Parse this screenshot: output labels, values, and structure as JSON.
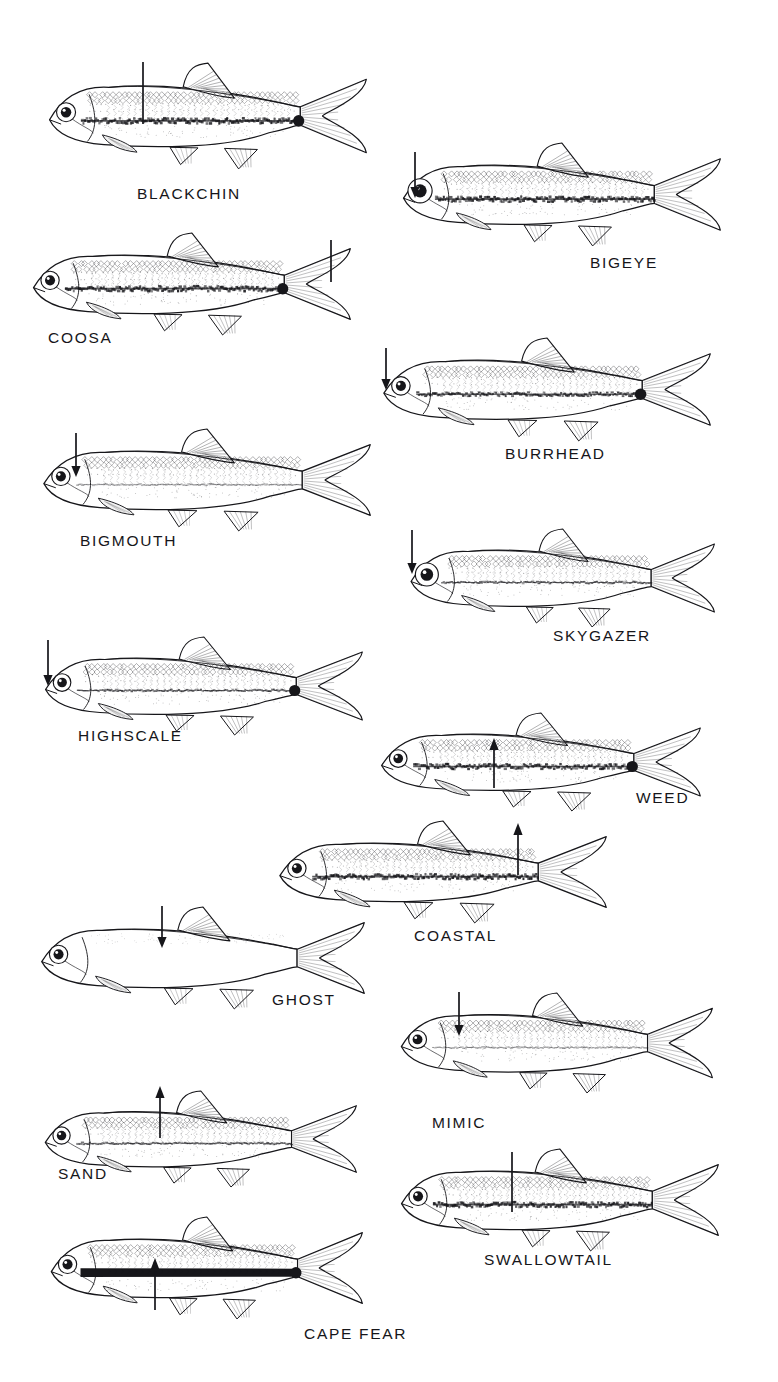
{
  "plate": {
    "kind": "scientific-illustration-plate",
    "subject": "shiner-species-identification",
    "background_color": "#ffffff",
    "ink_color": "#16161a",
    "width": 778,
    "height": 1382,
    "species_count": 14,
    "pointer_note": "Each illustration carries a line or arrow marking the diagnostic field character."
  },
  "species": [
    {
      "id": "blackchin",
      "label": "BLACKCHIN",
      "label_x": 137,
      "label_y": 186,
      "fish_x": 38,
      "fish_y": 62,
      "fish_w": 330,
      "fish_h": 108,
      "body_shade": "mid",
      "stripe": "broad-dark-midlateral",
      "caudal_spot": true,
      "pointer": {
        "style": "line",
        "x": 143,
        "y": 62,
        "length": 62,
        "direction": "down"
      }
    },
    {
      "id": "bigeye",
      "label": "BIGEYE",
      "label_x": 590,
      "label_y": 255,
      "fish_x": 392,
      "fish_y": 142,
      "fish_w": 330,
      "fish_h": 105,
      "body_shade": "mid",
      "stripe": "broad-dark-midlateral",
      "caudal_spot": false,
      "big_eye": true,
      "pointer": {
        "style": "arrow",
        "x": 415,
        "y": 152,
        "length": 40,
        "direction": "down"
      }
    },
    {
      "id": "coosa",
      "label": "COOSA",
      "label_x": 48,
      "label_y": 330,
      "fish_x": 22,
      "fish_y": 232,
      "fish_w": 330,
      "fish_h": 104,
      "body_shade": "dark-dorsum",
      "stripe": "broad-dark-midlateral",
      "caudal_spot": true,
      "pointer": {
        "style": "line",
        "x": 331,
        "y": 240,
        "length": 42,
        "direction": "down"
      }
    },
    {
      "id": "burrhead",
      "label": "BURRHEAD",
      "label_x": 505,
      "label_y": 446,
      "fish_x": 372,
      "fish_y": 337,
      "fish_w": 340,
      "fish_h": 105,
      "body_shade": "mid",
      "stripe": "dark-midlateral",
      "caudal_spot": true,
      "pointer": {
        "style": "arrow",
        "x": 386,
        "y": 348,
        "length": 36,
        "direction": "down"
      }
    },
    {
      "id": "bigmouth",
      "label": "BIGMOUTH",
      "label_x": 80,
      "label_y": 533,
      "fish_x": 32,
      "fish_y": 428,
      "fish_w": 340,
      "fish_h": 104,
      "body_shade": "light",
      "stripe": "faint-midlateral",
      "caudal_spot": false,
      "pointer": {
        "style": "arrow",
        "x": 76,
        "y": 433,
        "length": 38,
        "direction": "down"
      }
    },
    {
      "id": "skygazer",
      "label": "SKYGAZER",
      "label_x": 553,
      "label_y": 628,
      "fish_x": 400,
      "fish_y": 528,
      "fish_w": 316,
      "fish_h": 100,
      "body_shade": "light",
      "stripe": "thin-midlateral",
      "caudal_spot": false,
      "big_eye": true,
      "pointer": {
        "style": "arrow",
        "x": 412,
        "y": 530,
        "length": 38,
        "direction": "down"
      }
    },
    {
      "id": "highscale",
      "label": "HIGHSCALE",
      "label_x": 78,
      "label_y": 728,
      "fish_x": 34,
      "fish_y": 636,
      "fish_w": 330,
      "fish_h": 100,
      "body_shade": "light",
      "stripe": "thin-midlateral",
      "caudal_spot": true,
      "pointer": {
        "style": "arrow",
        "x": 48,
        "y": 640,
        "length": 40,
        "direction": "down"
      }
    },
    {
      "id": "weed",
      "label": "WEED",
      "label_x": 636,
      "label_y": 790,
      "fish_x": 370,
      "fish_y": 712,
      "fish_w": 332,
      "fish_h": 100,
      "body_shade": "mid",
      "stripe": "broad-dark-midlateral",
      "caudal_spot": true,
      "pointer": {
        "style": "arrow",
        "x": 494,
        "y": 788,
        "length": 42,
        "direction": "up"
      }
    },
    {
      "id": "coastal",
      "label": "COASTAL",
      "label_x": 414,
      "label_y": 928,
      "fish_x": 268,
      "fish_y": 820,
      "fish_w": 340,
      "fish_h": 104,
      "body_shade": "mid",
      "stripe": "broad-dark-midlateral",
      "caudal_spot": false,
      "pointer": {
        "style": "arrow",
        "x": 518,
        "y": 875,
        "length": 44,
        "direction": "up"
      }
    },
    {
      "id": "ghost",
      "label": "GHOST",
      "label_x": 272,
      "label_y": 992,
      "fish_x": 30,
      "fish_y": 906,
      "fish_w": 336,
      "fish_h": 104,
      "body_shade": "pale",
      "stripe": "none",
      "caudal_spot": false,
      "pointer": {
        "style": "arrow",
        "x": 162,
        "y": 906,
        "length": 36,
        "direction": "down"
      }
    },
    {
      "id": "mimic",
      "label": "MIMIC",
      "label_x": 432,
      "label_y": 1115,
      "fish_x": 390,
      "fish_y": 992,
      "fish_w": 324,
      "fish_h": 102,
      "body_shade": "light",
      "stripe": "faint-midlateral",
      "caudal_spot": false,
      "pointer": {
        "style": "arrow",
        "x": 459,
        "y": 992,
        "length": 38,
        "direction": "down"
      }
    },
    {
      "id": "sand",
      "label": "SAND",
      "label_x": 58,
      "label_y": 1166,
      "fish_x": 34,
      "fish_y": 1090,
      "fish_w": 324,
      "fish_h": 98,
      "body_shade": "light",
      "stripe": "thin-midlateral",
      "caudal_spot": false,
      "pointer": {
        "style": "arrow",
        "x": 160,
        "y": 1138,
        "length": 44,
        "direction": "up"
      }
    },
    {
      "id": "swallowtail",
      "label": "SWALLOWTAIL",
      "label_x": 484,
      "label_y": 1252,
      "fish_x": 390,
      "fish_y": 1148,
      "fish_w": 330,
      "fish_h": 104,
      "body_shade": "mid",
      "stripe": "broad-dark-midlateral",
      "caudal_spot": false,
      "pointer": {
        "style": "line",
        "x": 512,
        "y": 1152,
        "length": 60,
        "direction": "down"
      }
    },
    {
      "id": "cape-fear",
      "label": "CAPE FEAR",
      "label_x": 304,
      "label_y": 1326,
      "fish_x": 40,
      "fish_y": 1216,
      "fish_w": 324,
      "fish_h": 104,
      "body_shade": "mid",
      "stripe": "heavy-black-midlateral",
      "caudal_spot": true,
      "pointer": {
        "style": "arrow",
        "x": 155,
        "y": 1310,
        "length": 44,
        "direction": "up"
      }
    }
  ]
}
